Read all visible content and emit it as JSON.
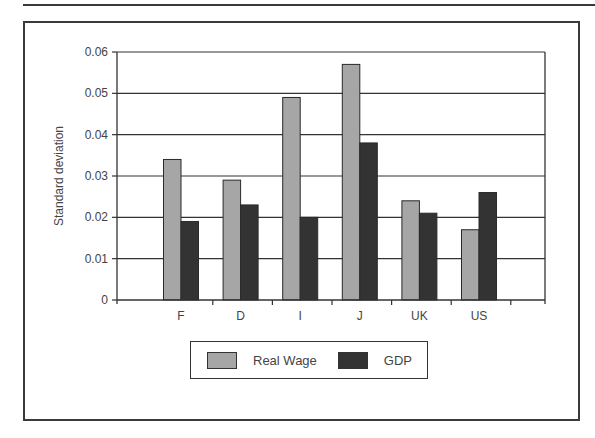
{
  "chart_data": {
    "type": "bar",
    "title": "",
    "xlabel": "",
    "ylabel": "Standard deviation",
    "ylim": [
      0,
      0.06
    ],
    "yticks": [
      "0",
      "0.01",
      "0.02",
      "0.03",
      "0.04",
      "0.05",
      "0.06"
    ],
    "grid": true,
    "legend_position": "bottom",
    "categories": [
      "F",
      "D",
      "I",
      "J",
      "UK",
      "US"
    ],
    "series": [
      {
        "name": "Real Wage",
        "color": "#a6a6a6",
        "values": [
          0.034,
          0.029,
          0.049,
          0.057,
          0.024,
          0.017
        ]
      },
      {
        "name": "GDP",
        "color": "#333333",
        "values": [
          0.019,
          0.023,
          0.02,
          0.038,
          0.021,
          0.026
        ]
      }
    ]
  },
  "legend": {
    "items": [
      {
        "label": "Real Wage",
        "color": "#a6a6a6"
      },
      {
        "label": "GDP",
        "color": "#333333"
      }
    ]
  }
}
